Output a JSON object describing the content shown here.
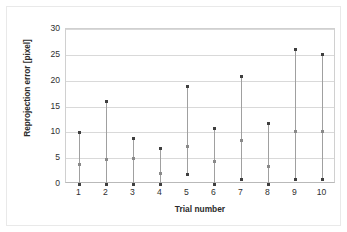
{
  "chart_data": {
    "type": "scatter",
    "title": "",
    "xlabel": "Trial number",
    "ylabel": "Reprojection error [pixel]",
    "categories": [
      "1",
      "2",
      "3",
      "4",
      "5",
      "6",
      "7",
      "8",
      "9",
      "10"
    ],
    "x": [
      1,
      2,
      3,
      4,
      5,
      6,
      7,
      8,
      9,
      10
    ],
    "xlim": [
      0.5,
      10.5
    ],
    "ylim": [
      0,
      30
    ],
    "y_ticks": [
      0,
      5,
      10,
      15,
      20,
      25,
      30
    ],
    "y_tick_labels": [
      "0",
      "5",
      "10",
      "15",
      "20",
      "25",
      "30"
    ],
    "grid": "horizontal",
    "legend": "none",
    "series": [
      {
        "name": "max",
        "values": [
          9.9,
          16.0,
          8.9,
          6.9,
          18.8,
          10.8,
          20.8,
          11.8,
          26.0,
          25.0
        ]
      },
      {
        "name": "mean",
        "values": [
          3.7,
          4.8,
          4.9,
          2.0,
          7.3,
          4.4,
          8.4,
          3.3,
          10.2,
          10.1
        ]
      },
      {
        "name": "min",
        "values": [
          0.0,
          0.0,
          0.0,
          0.0,
          1.8,
          0.0,
          0.8,
          0.0,
          0.9,
          0.95
        ]
      }
    ],
    "colors": {
      "marker": "#3f3f3f",
      "mean_marker": "#8a8a8a",
      "range_line": "#a0a0a0",
      "gridline": "#d9d9d9",
      "axis": "#b9b9b9",
      "frame": "#e9e9e9",
      "text": "#2f2f2f"
    }
  }
}
